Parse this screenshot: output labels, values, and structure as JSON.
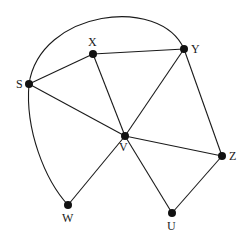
{
  "graph": {
    "nodes": [
      {
        "id": "S",
        "label": "S",
        "x": 29,
        "y": 84,
        "lx": 16,
        "ly": 88
      },
      {
        "id": "X",
        "label": "X",
        "x": 93,
        "y": 54,
        "lx": 88,
        "ly": 46
      },
      {
        "id": "Y",
        "label": "Y",
        "x": 184,
        "y": 49,
        "lx": 191,
        "ly": 53
      },
      {
        "id": "V",
        "label": "V",
        "x": 125,
        "y": 136,
        "lx": 119,
        "ly": 151
      },
      {
        "id": "Z",
        "label": "Z",
        "x": 222,
        "y": 156,
        "lx": 229,
        "ly": 160
      },
      {
        "id": "W",
        "label": "W",
        "x": 68,
        "y": 205,
        "lx": 62,
        "ly": 222
      },
      {
        "id": "U",
        "label": "U",
        "x": 172,
        "y": 213,
        "lx": 167,
        "ly": 230
      }
    ],
    "edges": [
      {
        "from": "S",
        "to": "X"
      },
      {
        "from": "S",
        "to": "V"
      },
      {
        "from": "X",
        "to": "Y"
      },
      {
        "from": "X",
        "to": "V"
      },
      {
        "from": "Y",
        "to": "V"
      },
      {
        "from": "Y",
        "to": "Z"
      },
      {
        "from": "V",
        "to": "Z"
      },
      {
        "from": "V",
        "to": "W"
      },
      {
        "from": "V",
        "to": "U"
      },
      {
        "from": "Z",
        "to": "U"
      }
    ],
    "curved_edges": [
      {
        "from": "S",
        "to": "Y",
        "path": "M29,84 C40,10 160,-5 184,49"
      },
      {
        "from": "S",
        "to": "W",
        "path": "M29,84 C25,130 45,180 68,205"
      }
    ]
  },
  "colors": {
    "stroke": "#1a1a1a",
    "node": "#111111",
    "background": "#ffffff"
  }
}
